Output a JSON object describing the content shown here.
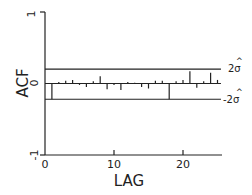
{
  "chart_data": {
    "type": "bar",
    "title": "",
    "xlabel": "LAG",
    "ylabel": "ACF",
    "xlim": [
      0,
      25
    ],
    "ylim": [
      -1,
      1
    ],
    "x_ticks": [
      0,
      10,
      20
    ],
    "y_ticks": [
      -1,
      0,
      1
    ],
    "grid": false,
    "legend": null,
    "x": [
      1,
      2,
      3,
      4,
      5,
      6,
      7,
      8,
      9,
      10,
      11,
      12,
      13,
      14,
      15,
      16,
      17,
      18,
      19,
      20,
      21,
      22,
      23,
      24,
      25
    ],
    "values": [
      -0.22,
      0.02,
      0.04,
      0.05,
      -0.02,
      -0.05,
      0.03,
      0.1,
      -0.08,
      -0.02,
      -0.09,
      0.02,
      0.01,
      -0.05,
      -0.07,
      0.04,
      0.04,
      -0.22,
      0.03,
      0.05,
      0.17,
      -0.06,
      0.03,
      0.15,
      0.05
    ],
    "series": [
      {
        "name": "ACF",
        "values": [
          -0.22,
          0.02,
          0.04,
          0.05,
          -0.02,
          -0.05,
          0.03,
          0.1,
          -0.08,
          -0.02,
          -0.09,
          0.02,
          0.01,
          -0.05,
          -0.07,
          0.04,
          0.04,
          -0.22,
          0.03,
          0.05,
          0.17,
          -0.06,
          0.03,
          0.15,
          0.05
        ]
      }
    ],
    "bands": {
      "upper": 0.2,
      "lower": -0.22
    },
    "annotations": [
      "2σ̂",
      "-2σ̂"
    ]
  },
  "labels": {
    "y_axis": "ACF",
    "x_axis": "LAG",
    "y_tick_top": "1",
    "y_tick_zero": "0",
    "y_tick_bottom": "-1",
    "x_tick_0": "0",
    "x_tick_10": "10",
    "x_tick_20": "20",
    "upper_band": "2σ",
    "lower_band": "-2σ",
    "hat": "^"
  },
  "colors": {
    "ink": "#222222",
    "background": "#ffffff"
  }
}
